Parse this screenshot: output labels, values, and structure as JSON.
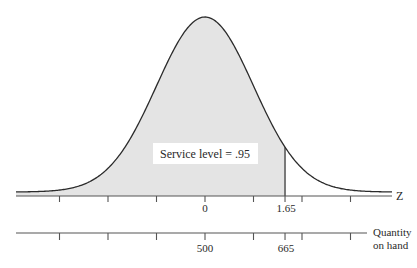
{
  "chart_data": {
    "type": "area",
    "title": "",
    "annotation": "Service level = .95",
    "curve": {
      "distribution": "normal",
      "mean_z": 0,
      "sd_z": 1,
      "shaded_from_z": -3.9,
      "shaded_to_z": 1.65
    },
    "axes": [
      {
        "name": "z-axis",
        "label": "Z",
        "tick_values": [
          -3,
          -2,
          -1,
          0,
          1,
          1.65,
          2,
          3
        ],
        "tick_labels": [
          "",
          "",
          "",
          "0",
          "",
          "1.65",
          "",
          ""
        ]
      },
      {
        "name": "quantity-axis",
        "label_line1": "Quantity",
        "label_line2": "on hand",
        "tick_values_z": [
          -3,
          -2,
          -1,
          0,
          1,
          1.65,
          2,
          3
        ],
        "tick_labels": [
          "",
          "",
          "",
          "500",
          "",
          "665",
          "",
          ""
        ],
        "mean": 500,
        "value_at_service_level": 665
      }
    ],
    "service_level": 0.95,
    "z_value": 1.65,
    "grid": false,
    "legend": "none"
  },
  "labels": {
    "service_level": "Service level = .95",
    "z_axis_label": "Z",
    "z_zero": "0",
    "z_critical": "1.65",
    "qty_label_1": "Quantity",
    "qty_label_2": "on hand",
    "qty_mean": "500",
    "qty_critical": "665"
  },
  "colors": {
    "shade": "#e4e4e4",
    "line": "#2b2b2b",
    "axis": "#555555",
    "label_bg": "#ffffff"
  }
}
